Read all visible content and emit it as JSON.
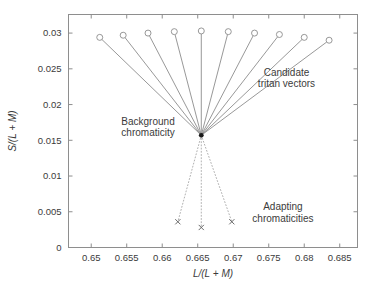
{
  "chart_data": {
    "type": "scatter",
    "title": "",
    "xlabel": "L/(L + M)",
    "ylabel": "S/(L + M)",
    "xlim": [
      0.6468,
      0.6875
    ],
    "ylim": [
      0.0,
      0.0326
    ],
    "xticks": [
      0.65,
      0.655,
      0.66,
      0.665,
      0.67,
      0.675,
      0.68,
      0.685
    ],
    "xticklabels": [
      "0.65",
      "0.655",
      "0.66",
      "0.665",
      "0.67",
      "0.675",
      "0.68",
      "0.685"
    ],
    "yticks": [
      0,
      0.005,
      0.01,
      0.015,
      0.02,
      0.025,
      0.03
    ],
    "yticklabels": [
      "0",
      "0.005",
      "0.01",
      "0.015",
      "0.02",
      "0.025",
      "0.03"
    ],
    "grid": false,
    "legend": "none",
    "box": true,
    "background_chromaticity": {
      "x": 0.6655,
      "y": 0.0157
    },
    "series": [
      {
        "name": "Candidate tritan vectors",
        "style": "line-with-open-circle-endpoint",
        "color": "#8c8c8c",
        "endpoints": [
          {
            "x": 0.6512,
            "y": 0.0294
          },
          {
            "x": 0.6545,
            "y": 0.0297
          },
          {
            "x": 0.658,
            "y": 0.03
          },
          {
            "x": 0.6617,
            "y": 0.0302
          },
          {
            "x": 0.6655,
            "y": 0.0303
          },
          {
            "x": 0.6693,
            "y": 0.0302
          },
          {
            "x": 0.673,
            "y": 0.03
          },
          {
            "x": 0.6765,
            "y": 0.0298
          },
          {
            "x": 0.68,
            "y": 0.0294
          },
          {
            "x": 0.6835,
            "y": 0.029
          }
        ]
      },
      {
        "name": "Adapting chromaticities",
        "style": "dotted-line-with-cross-endpoint",
        "color": "#a8a8a8",
        "endpoints": [
          {
            "x": 0.6622,
            "y": 0.0036
          },
          {
            "x": 0.6655,
            "y": 0.0028
          },
          {
            "x": 0.6698,
            "y": 0.0036
          }
        ]
      }
    ],
    "annotations": [
      {
        "id": "background-chromaticity",
        "line1": "Background",
        "line2": "chromaticity",
        "x": 0.658,
        "y": 0.0172,
        "anchor": "middle"
      },
      {
        "id": "candidate-tritan-vectors",
        "line1": "Candidate",
        "line2": "tritan vectors",
        "x": 0.6775,
        "y": 0.024,
        "anchor": "middle"
      },
      {
        "id": "adapting-chromaticities",
        "line1": "Adapting",
        "line2": "chromaticities",
        "x": 0.677,
        "y": 0.0052,
        "anchor": "middle"
      }
    ]
  }
}
